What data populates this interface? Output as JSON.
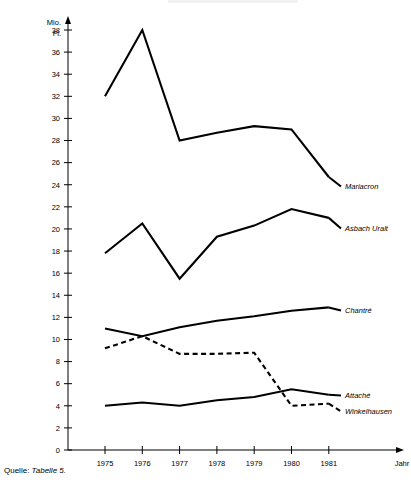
{
  "chart_data": {
    "type": "line",
    "title": "",
    "xlabel": "Jahr",
    "ylabel": "Mio. Fl.",
    "ylabel_lines": [
      "Mio.",
      "Fl."
    ],
    "x": [
      1975,
      1976,
      1977,
      1978,
      1979,
      1980,
      1981
    ],
    "categories": [
      "1975",
      "1976",
      "1977",
      "1978",
      "1979",
      "1980",
      "1981"
    ],
    "xlim": [
      1974.6,
      1981.4
    ],
    "ylim": [
      0,
      39
    ],
    "yticks": [
      0,
      2,
      4,
      6,
      8,
      10,
      12,
      14,
      16,
      18,
      20,
      22,
      24,
      26,
      28,
      30,
      32,
      34,
      36,
      38
    ],
    "ytick_labels": [
      "0",
      "2",
      "4",
      "6",
      "8",
      "10",
      "12",
      "14",
      "16",
      "18",
      "20",
      "22",
      "24",
      "26",
      "28",
      "30",
      "32",
      "34",
      "36",
      "38"
    ],
    "grid": false,
    "legend_position": "right-inline-labels",
    "series": [
      {
        "name": "Mariacron",
        "style": "solid",
        "values": [
          32.0,
          38.0,
          28.0,
          28.7,
          29.3,
          29.0,
          24.7
        ]
      },
      {
        "name": "Asbach Uralt",
        "style": "solid",
        "values": [
          17.8,
          20.5,
          15.5,
          19.3,
          20.3,
          21.8,
          21.0
        ]
      },
      {
        "name": "Chantré",
        "style": "solid",
        "values": [
          11.0,
          10.3,
          11.1,
          11.7,
          12.1,
          12.6,
          12.9
        ]
      },
      {
        "name": "Attaché",
        "style": "solid",
        "values": [
          4.0,
          4.3,
          4.0,
          4.5,
          4.8,
          5.5,
          5.0
        ]
      },
      {
        "name": "Winkelhausen",
        "style": "dashed",
        "values": [
          9.2,
          10.3,
          8.7,
          8.7,
          8.8,
          4.0,
          4.2
        ]
      }
    ]
  },
  "source": {
    "prefix": "Quelle:",
    "reference": "Tabelle 5."
  },
  "colors": {
    "line": "#000000",
    "axis": "#000000",
    "background": "#ffffff"
  }
}
